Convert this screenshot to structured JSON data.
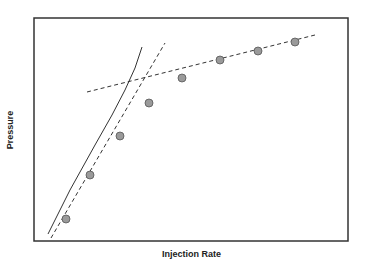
{
  "chart_data": {
    "type": "scatter",
    "title": "",
    "xlabel": "Injection Rate",
    "ylabel": "Pressure",
    "grid": false,
    "legend": null,
    "axis_ticks": false,
    "plot_frame_px": {
      "left": 34,
      "top": 18,
      "right": 348,
      "bottom": 241
    },
    "points_px": [
      {
        "x": 66,
        "y": 219
      },
      {
        "x": 90,
        "y": 175
      },
      {
        "x": 120,
        "y": 136
      },
      {
        "x": 149,
        "y": 103
      },
      {
        "x": 182,
        "y": 78
      },
      {
        "x": 220,
        "y": 60
      },
      {
        "x": 258,
        "y": 51
      },
      {
        "x": 295,
        "y": 42
      }
    ],
    "lines": [
      {
        "name": "curve",
        "style": "solid",
        "points_px": [
          [
            48,
            234
          ],
          [
            70,
            190
          ],
          [
            95,
            145
          ],
          [
            112,
            115
          ],
          [
            125,
            90
          ],
          [
            135,
            68
          ],
          [
            142,
            47
          ]
        ]
      },
      {
        "name": "steep-trend",
        "style": "dashed",
        "points_px": [
          [
            51,
            238
          ],
          [
            165,
            43
          ]
        ]
      },
      {
        "name": "shallow-trend",
        "style": "dashed",
        "points_px": [
          [
            87,
            92
          ],
          [
            315,
            35
          ]
        ]
      }
    ],
    "colors": {
      "point_fill": "#9a9a9a",
      "point_stroke": "#555555",
      "line": "#333333",
      "frame": "#333333"
    }
  }
}
